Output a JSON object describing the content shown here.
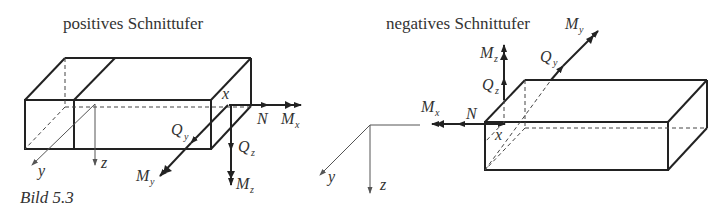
{
  "figure": {
    "caption": "Bild 5.3",
    "left_panel": {
      "title": "positives Schnittufer",
      "labels": {
        "x": "x",
        "y": "y",
        "z": "z",
        "N": "N",
        "Mx_main": "M",
        "Mx_sub": "x",
        "Qy_main": "Q",
        "Qy_sub": "y",
        "Qz_main": "Q",
        "Qz_sub": "z",
        "My_main": "M",
        "My_sub": "y",
        "Mz_main": "M",
        "Mz_sub": "z"
      }
    },
    "right_panel": {
      "title": "negatives Schnittufer",
      "labels": {
        "x": "x",
        "y": "y",
        "z": "z",
        "N": "N",
        "Mx_main": "M",
        "Mx_sub": "x",
        "Qy_main": "Q",
        "Qy_sub": "y",
        "Qz_main": "Q",
        "Qz_sub": "z",
        "My_main": "M",
        "My_sub": "y",
        "Mz_main": "M",
        "Mz_sub": "z"
      }
    }
  }
}
